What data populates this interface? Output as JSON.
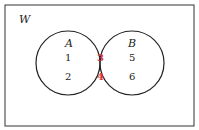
{
  "diagram": {
    "type": "venn",
    "universe_label": "W",
    "sets": [
      {
        "label": "A",
        "only_elements": [
          "1",
          "2"
        ]
      },
      {
        "label": "B",
        "only_elements": [
          "5",
          "6"
        ]
      }
    ],
    "intersection": {
      "elements": [
        "3",
        "4"
      ],
      "fill": "#f0b8b8",
      "text_color": "#e0303a"
    },
    "colors": {
      "stroke": "#222222",
      "background": "#ffffff"
    }
  }
}
